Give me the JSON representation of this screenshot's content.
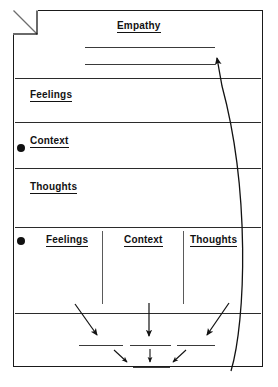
{
  "document": {
    "title": "Empathy",
    "corner_fold": "folded-page-corner"
  },
  "sections": [
    {
      "id": "empathy",
      "label": "Empathy",
      "bullet": false
    },
    {
      "id": "feelings-1",
      "label": "Feelings",
      "bullet": false
    },
    {
      "id": "context-1",
      "label": "Context",
      "bullet": true
    },
    {
      "id": "thoughts-1",
      "label": "Thoughts",
      "bullet": false
    }
  ],
  "columns": {
    "bullet": true,
    "headers": [
      "Feelings",
      "Context",
      "Thoughts"
    ]
  },
  "colors": {
    "ink": "#121212",
    "rule": "#2b2b2b",
    "border": "#1a1a1a",
    "paper": "#ffffff"
  },
  "annotations": {
    "curved_arrow": "curved-arrow-up-right",
    "converging_arrows": "three-arrows-converging-down",
    "final_arrows": "two-arrows-converging-down"
  },
  "write_in_lines": {
    "empathy_lines": 2,
    "result_lines_row1": 3,
    "result_lines_row2": 1
  }
}
